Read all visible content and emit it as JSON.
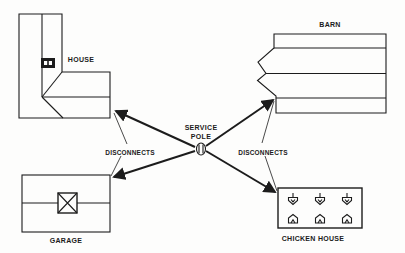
{
  "figure": {
    "type": "farm-electrical-distribution-diagram",
    "background_color": "#fdfdfc",
    "line_color": "#1c1c1c"
  },
  "labels": {
    "house": "HOUSE",
    "barn": "BARN",
    "garage": "GARAGE",
    "chicken_house": "CHICKEN HOUSE",
    "service_pole_line1": "SERVICE",
    "service_pole_line2": "POLE",
    "disconnects_left": "DISCONNECTS",
    "disconnects_right": "DISCONNECTS"
  },
  "icons": {
    "service_pole": "pole-top-view-circle-hatched",
    "house_meter": "black-meter-panel-two-windows",
    "garage_vent": "crossed-box",
    "chicken_fixture_top": "hanging-fixture",
    "chicken_fixture_bottom": "floor-fixture"
  },
  "connections": [
    {
      "from": "service-pole",
      "to": "house",
      "style": "arrow"
    },
    {
      "from": "service-pole",
      "to": "garage",
      "style": "arrow"
    },
    {
      "from": "service-pole",
      "to": "barn",
      "style": "arrow"
    },
    {
      "from": "service-pole",
      "to": "chicken-house",
      "style": "arrow"
    }
  ]
}
